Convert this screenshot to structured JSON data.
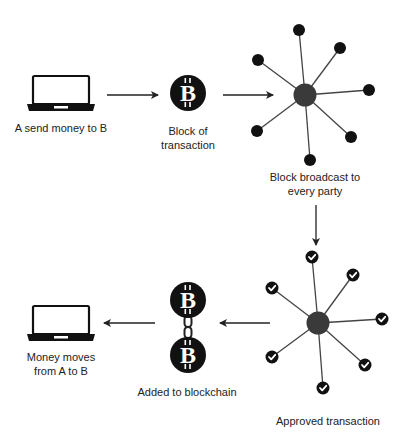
{
  "colors": {
    "ink": "#111111",
    "hub": "#3a3a3a",
    "edge": "#444444",
    "text": "#222222",
    "background": "#ffffff"
  },
  "steps": [
    {
      "id": "send",
      "icon": "laptop-icon",
      "label_lines": [
        "A send money to B"
      ]
    },
    {
      "id": "block",
      "icon": "bitcoin-coin-icon",
      "label_lines": [
        "Block of",
        "transaction"
      ]
    },
    {
      "id": "broadcast",
      "icon": "network-star-icon",
      "label_lines": [
        "Block broadcast to",
        "every party"
      ]
    },
    {
      "id": "approved",
      "icon": "network-star-check-icon",
      "label_lines": [
        "Approved transaction"
      ]
    },
    {
      "id": "chain",
      "icon": "chained-bitcoin-icon",
      "label_lines": [
        "Added to blockchain"
      ]
    },
    {
      "id": "receive",
      "icon": "laptop-icon",
      "label_lines": [
        "Money moves",
        "from A to B"
      ]
    }
  ],
  "flow": [
    {
      "from": "send",
      "to": "block",
      "direction": "right"
    },
    {
      "from": "block",
      "to": "broadcast",
      "direction": "right"
    },
    {
      "from": "broadcast",
      "to": "approved",
      "direction": "down"
    },
    {
      "from": "approved",
      "to": "chain",
      "direction": "left"
    },
    {
      "from": "chain",
      "to": "receive",
      "direction": "left"
    }
  ],
  "network_nodes": 7
}
